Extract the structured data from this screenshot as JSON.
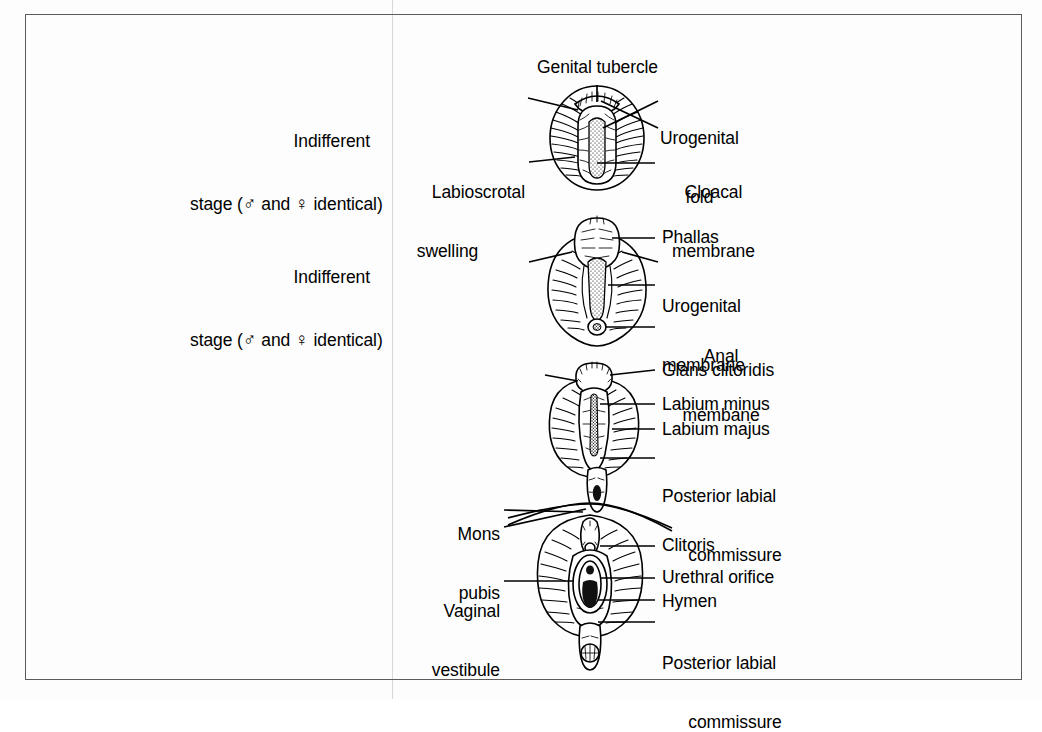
{
  "figure": {
    "background_color": "#fdfdfd",
    "border_color": "#5b5b5b",
    "ink_color": "#000000"
  },
  "panels": [
    {
      "id": "panel-1",
      "stage_label": {
        "line1": "Indifferent",
        "line2_pre": "stage (",
        "male_symbol": "♂",
        "line2_mid": " and ",
        "female_symbol": "♀",
        "line2_post": " identical)"
      },
      "labels": [
        {
          "name": "genital-tubercle",
          "text": "Genital tubercle",
          "side": "top"
        },
        {
          "name": "urogenital-fold",
          "text": "Urogenital\nfold",
          "side": "right"
        },
        {
          "name": "cloacal-membrane",
          "text": "Cloacal\nmembrane",
          "side": "right"
        },
        {
          "name": "labioscrotal-swelling",
          "text": "Labioscrotal\nswelling",
          "side": "left"
        }
      ]
    },
    {
      "id": "panel-2",
      "stage_label": {
        "line1": "Indifferent",
        "line2_pre": "stage (",
        "male_symbol": "♂",
        "line2_mid": " and ",
        "female_symbol": "♀",
        "line2_post": " identical)"
      },
      "labels": [
        {
          "name": "phallas",
          "text": "Phallas",
          "side": "right"
        },
        {
          "name": "urogenital-membrane",
          "text": "Urogenital\nmembrane",
          "side": "right"
        },
        {
          "name": "anal-membane",
          "text": "Anal\nmembane",
          "side": "right"
        }
      ]
    },
    {
      "id": "panel-3",
      "stage_label": null,
      "labels": [
        {
          "name": "glans-clitoridis",
          "text": "Glans clitoridis",
          "side": "right"
        },
        {
          "name": "labium-minus",
          "text": "Labium minus",
          "side": "right"
        },
        {
          "name": "labium-majus",
          "text": "Labium majus",
          "side": "right"
        },
        {
          "name": "posterior-labial-commissure",
          "text": "Posterior labial\ncommissure",
          "side": "right"
        }
      ]
    },
    {
      "id": "panel-4",
      "stage_label": null,
      "labels": [
        {
          "name": "mons-pubis",
          "text": "Mons\npubis",
          "side": "left"
        },
        {
          "name": "vaginal-vestibule",
          "text": "Vaginal\nvestibule",
          "side": "left"
        },
        {
          "name": "clitoris",
          "text": "Clitoris",
          "side": "right"
        },
        {
          "name": "urethral-orifice",
          "text": "Urethral orifice",
          "side": "right"
        },
        {
          "name": "hymen",
          "text": "Hymen",
          "side": "right"
        },
        {
          "name": "posterior-labial-commissure",
          "text": "Posterior labial\ncommissure",
          "side": "right"
        }
      ]
    }
  ],
  "text": {
    "p1_stage_l1": "Indifferent",
    "p1_stage_pre": "stage (",
    "p1_stage_mid": " and ",
    "p1_stage_post": " identical)",
    "p1_genital_tubercle": "Genital tubercle",
    "p1_urogenital_fold_1": "Urogenital",
    "p1_urogenital_fold_2": "fold",
    "p1_cloacal_1": "Cloacal",
    "p1_cloacal_2": "membrane",
    "p1_labioscrotal_1": "Labioscrotal",
    "p1_labioscrotal_2": "swelling",
    "p2_stage_l1": "Indifferent",
    "p2_stage_pre": "stage (",
    "p2_stage_mid": " and ",
    "p2_stage_post": " identical)",
    "p2_phallas": "Phallas",
    "p2_urogenital_1": "Urogenital",
    "p2_urogenital_2": "membrane",
    "p2_anal_1": "Anal",
    "p2_anal_2": "membane",
    "p3_glans": "Glans clitoridis",
    "p3_labium_minus": "Labium minus",
    "p3_labium_majus": "Labium majus",
    "p3_posterior_1": "Posterior labial",
    "p3_posterior_2": "commissure",
    "p4_mons_1": "Mons",
    "p4_mons_2": "pubis",
    "p4_vaginal_1": "Vaginal",
    "p4_vaginal_2": "vestibule",
    "p4_clitoris": "Clitoris",
    "p4_urethral": "Urethral orifice",
    "p4_hymen": "Hymen",
    "p4_posterior_1": "Posterior labial",
    "p4_posterior_2": "commissure",
    "male_symbol": "♂",
    "female_symbol": "♀"
  }
}
